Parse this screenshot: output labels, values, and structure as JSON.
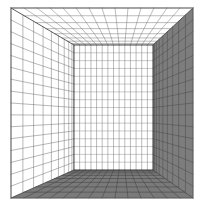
{
  "figure": {
    "type": "line-diagram",
    "background_color": "#ffffff",
    "canvas": {
      "width": 205,
      "height": 210
    }
  },
  "geometry": {
    "front_rect": {
      "x0": 11,
      "y0": 8,
      "x1": 193,
      "y1": 198
    },
    "back_rect": {
      "x0": 74,
      "y0": 45,
      "x1": 153,
      "y1": 170
    },
    "vanishing_point": {
      "x": 113,
      "y": 108
    },
    "divisions": {
      "back_wall_cols": 14,
      "back_wall_rows": 16,
      "depth_steps_left": 9,
      "depth_steps_right": 9,
      "floor_depth_steps": 8,
      "ceiling_depth_steps": 8
    }
  },
  "surfaces": [
    {
      "name": "back-wall",
      "label": "Back wall",
      "fill": "#ffffff",
      "grid_color": "#6e6e6e",
      "grid_opacity": 0.85
    },
    {
      "name": "left-wall",
      "label": "Left wall",
      "fill": "#ffffff",
      "grid_color": "#6e6e6e",
      "grid_opacity": 0.9
    },
    {
      "name": "right-wall",
      "label": "Right wall",
      "fill": "#7d7d7d",
      "grid_color": "#4a4a4a",
      "grid_opacity": 0.9
    },
    {
      "name": "ceiling",
      "label": "Ceiling",
      "fill": "#ffffff",
      "grid_color": "#6e6e6e",
      "grid_opacity": 0.85
    },
    {
      "name": "floor",
      "label": "Floor",
      "fill": "#7a7a7a",
      "grid_color": "#3f3f3f",
      "grid_opacity": 0.95
    }
  ],
  "strokes": {
    "outer_frame_color": "#5a5a5a",
    "outer_frame_width": 1.1,
    "edge_color": "#4a4a4a",
    "edge_width": 0.9,
    "grid_width": 0.55
  },
  "chart_data": {
    "type": "line",
    "xlabel": "",
    "ylabel": ""
  }
}
